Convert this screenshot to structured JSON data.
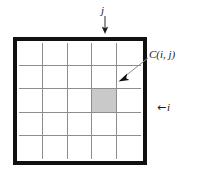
{
  "figure": {
    "name": "grid-cell-index-diagram",
    "background_color": "#ffffff",
    "frame_color": "#111111",
    "gridline_color": "#8d8d8d",
    "shaded_cell_color": "#c9c9c9",
    "annotation_line_color": "#808080"
  },
  "grid": {
    "columns": 5,
    "rows": 5,
    "shaded_cell": {
      "row": 3,
      "column": 4
    }
  },
  "labels": {
    "j": "j",
    "cij": "C(i, j)",
    "i": "i",
    "i_arrow": "←"
  },
  "annotations": {
    "j_arrow": {
      "direction": "down",
      "from": [
        105,
        16
      ],
      "to": [
        105,
        33
      ]
    },
    "cij_arrow": {
      "direction": "down-left",
      "from": [
        148,
        57
      ],
      "to": [
        119,
        80
      ]
    },
    "i_arrow": {
      "direction": "left"
    }
  }
}
